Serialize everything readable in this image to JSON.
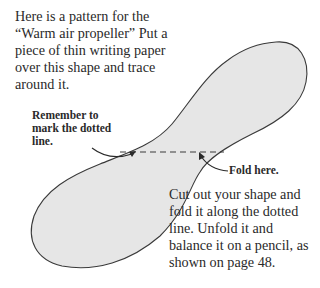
{
  "page": {
    "intro_text": "Here is a pattern for the “Warm air propeller” Put a piece of thin writing paper over this shape and trace around it.",
    "callout_remember": "Remember to mark the dotted line.",
    "callout_fold": "Fold here.",
    "outro_text": "Cut out your shape and fold it along the dotted line. Unfold it and balance it on a pencil, as shown on page 48."
  },
  "colors": {
    "shape_fill": "#e6e6e6",
    "shape_stroke": "#3a3a3a",
    "text": "#2a2a2a"
  }
}
